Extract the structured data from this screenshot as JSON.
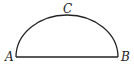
{
  "diagram": {
    "type": "semicircle",
    "points": [
      {
        "label": "A",
        "x": 16,
        "y": 57
      },
      {
        "label": "B",
        "x": 118,
        "y": 57
      },
      {
        "label": "C",
        "x": 67,
        "y": 15
      }
    ],
    "stroke_color": "#222222"
  }
}
